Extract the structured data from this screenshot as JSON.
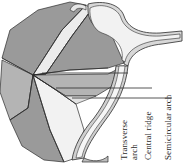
{
  "figure": {
    "background_color": "#ffffff",
    "line_color": "#2b2b2b",
    "palette": {
      "shade_dark": "#9a9a9a",
      "shade_mid": "#b4b4b4",
      "shade_light": "#d6d6d6",
      "shade_pale": "#ececec",
      "shade_white": "#f7f7f7",
      "outline": "#2b2b2b",
      "text": "#2b2b2b"
    }
  },
  "labels": [
    {
      "id": "transverse-arch",
      "line1": "Transverse",
      "line2": "arch",
      "full": "Transverse arch",
      "leader_y": 73,
      "leader_x_start": 42,
      "leader_x_end": 128,
      "text_x": 126,
      "text_y": 160,
      "text_x_2": 136,
      "rotation": -90
    },
    {
      "id": "central-ridge",
      "line1": "Central ridge",
      "line2": "",
      "full": "Central ridge",
      "leader_y": 88,
      "leader_x_start": 56,
      "leader_x_end": 152,
      "text_x": 150,
      "text_y": 160,
      "text_x_2": 0,
      "rotation": -90
    },
    {
      "id": "semicircular-arch",
      "line1": "Semicircular arch",
      "line2": "",
      "full": "Semicircular arch",
      "leader_y": 98,
      "leader_x_start": 72,
      "leader_x_end": 172,
      "text_x": 170,
      "text_y": 160,
      "text_x_2": 0,
      "rotation": -90
    }
  ]
}
